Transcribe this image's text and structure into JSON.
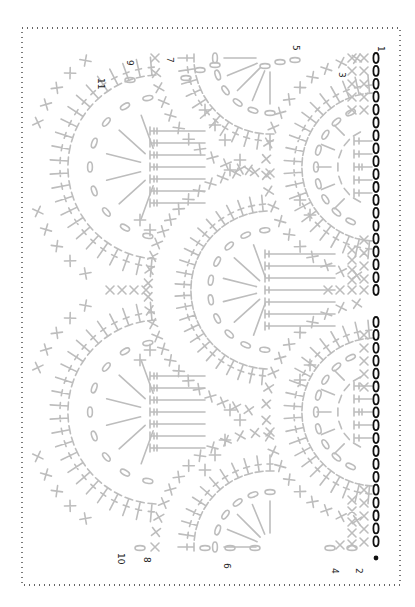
{
  "diagram": {
    "type": "crochet-stitch-chart",
    "orientation": "rotated-90",
    "colors": {
      "background": "#ffffff",
      "border": "#333333",
      "stitches": "#bdbdbd",
      "foundation_chain": "#111111"
    },
    "foundation": {
      "chain_count_top": 18,
      "chain_count_bottom": 19,
      "center_chain": 1
    },
    "row_labels": [
      {
        "text": "1",
        "x": 378,
        "y": 46
      },
      {
        "text": "2",
        "x": 356,
        "y": 568
      },
      {
        "text": "3",
        "x": 339,
        "y": 72
      },
      {
        "text": "4",
        "x": 332,
        "y": 568
      },
      {
        "text": "5",
        "x": 293,
        "y": 45
      },
      {
        "text": "6",
        "x": 224,
        "y": 563
      },
      {
        "text": "7",
        "x": 167,
        "y": 57
      },
      {
        "text": "8",
        "x": 144,
        "y": 557
      },
      {
        "text": "9",
        "x": 127,
        "y": 60
      },
      {
        "text": "10",
        "x": 118,
        "y": 553
      },
      {
        "text": "11",
        "x": 98,
        "y": 78
      }
    ]
  }
}
